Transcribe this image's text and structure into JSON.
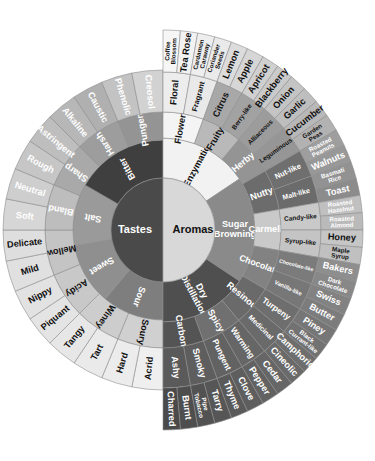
{
  "figure": {
    "center_left_label": "Tastes",
    "center_right_label": "Aromas"
  },
  "palette": {
    "center_dark": "#4a4a4a",
    "center_light": "#d8d8d8",
    "taste_ring1": "#8f8f8f",
    "taste_ring2": "#b8b8b8",
    "taste_ring3": "#e8e8e8",
    "aroma_ring1": "#6e6e6e",
    "aroma_ring2": "#8a8a8a",
    "aroma_ring3": "#bdbdbd",
    "aroma_ring4": "#9a9a9a",
    "stroke": "#8d8d8d",
    "bitter": "#3f3f3f",
    "dry_distillation": "#4f4f4f"
  },
  "chart_data": {
    "type": "pie",
    "legend": "none",
    "grid": false,
    "halves": [
      {
        "name": "Tastes",
        "side": "left",
        "start_angle": 90,
        "end_angle": 270,
        "ring1": [
          {
            "label": "Sour",
            "fill": "#7e7e7e",
            "text": "light",
            "span": 2
          },
          {
            "label": "Sweet",
            "fill": "#8f8f8f",
            "text": "light",
            "span": 2
          },
          {
            "label": "Salt",
            "fill": "#9a9a9a",
            "text": "light",
            "span": 2
          },
          {
            "label": "Bitter",
            "fill": "#3f3f3f",
            "text": "light",
            "span": 3
          }
        ],
        "ring2": [
          {
            "label": "Soury",
            "fill": "#d0d0d0",
            "text": "dark"
          },
          {
            "label": "Winey",
            "fill": "#cdcdcd",
            "text": "dark"
          },
          {
            "label": "Acidy",
            "fill": "#c8c8c8",
            "text": "dark"
          },
          {
            "label": "Mellow",
            "fill": "#c4c4c4",
            "text": "dark"
          },
          {
            "label": "Bland",
            "fill": "#bdbdbd",
            "text": "light"
          },
          {
            "label": "Sharp",
            "fill": "#a9a9a9",
            "text": "light"
          },
          {
            "label": "Harsh",
            "fill": "#9d9d9d",
            "text": "light"
          },
          {
            "label": "Pungent",
            "fill": "#949494",
            "text": "light"
          }
        ],
        "ring3": [
          {
            "label": "Acrid",
            "fill": "#efefef",
            "text": "dark"
          },
          {
            "label": "Hard",
            "fill": "#ececec",
            "text": "dark"
          },
          {
            "label": "Tart",
            "fill": "#eaeaea",
            "text": "dark"
          },
          {
            "label": "Tangy",
            "fill": "#e7e7e7",
            "text": "dark"
          },
          {
            "label": "Piquant",
            "fill": "#e4e4e4",
            "text": "dark"
          },
          {
            "label": "Nippy",
            "fill": "#e2e2e2",
            "text": "dark"
          },
          {
            "label": "Mild",
            "fill": "#e0e0e0",
            "text": "dark"
          },
          {
            "label": "Delicate",
            "fill": "#dedede",
            "text": "dark"
          },
          {
            "label": "Soft",
            "fill": "#d6d6d6",
            "text": "light"
          },
          {
            "label": "Neutral",
            "fill": "#cecece",
            "text": "light"
          },
          {
            "label": "Rough",
            "fill": "#c6c6c6",
            "text": "light"
          },
          {
            "label": "Astringent",
            "fill": "#bebebe",
            "text": "light"
          },
          {
            "label": "Alkaline",
            "fill": "#b7b7b7",
            "text": "light"
          },
          {
            "label": "Caustic",
            "fill": "#b0b0b0",
            "text": "light"
          },
          {
            "label": "Phenolic",
            "fill": "#c3c3c3",
            "text": "light"
          },
          {
            "label": "Creosol",
            "fill": "#d2d2d2",
            "text": "light"
          }
        ]
      },
      {
        "name": "Aromas",
        "side": "right",
        "start_angle": -90,
        "end_angle": 90,
        "ring1": [
          {
            "label": "Enzymatic",
            "fill": "#f2f2f2",
            "text": "dark",
            "span": 5
          },
          {
            "label": "Sugar Browning",
            "fill": "#8a8a8a",
            "text": "light",
            "span": 6
          },
          {
            "label": "Dry Distillation",
            "fill": "#4f4f4f",
            "text": "light",
            "span": 5
          }
        ],
        "ring2": [
          {
            "label": "Flowery",
            "fill": "#f4f4f4",
            "text": "dark",
            "span": 2
          },
          {
            "label": "Fruity",
            "fill": "#b9b9b9",
            "text": "dark",
            "span": 2
          },
          {
            "label": "Herby",
            "fill": "#949494",
            "text": "light",
            "span": 2
          },
          {
            "label": "Nutty",
            "fill": "#6c6c6c",
            "text": "light",
            "span": 2
          },
          {
            "label": "Carmelly",
            "fill": "#c9c9c9",
            "text": "light",
            "span": 2
          },
          {
            "label": "Chocolatey",
            "fill": "#828282",
            "text": "light",
            "span": 2
          },
          {
            "label": "Resinous",
            "fill": "#6a6a6a",
            "text": "light",
            "span": 2
          },
          {
            "label": "Spicy",
            "fill": "#707070",
            "text": "light",
            "span": 2
          },
          {
            "label": "Carbony",
            "fill": "#545454",
            "text": "light",
            "span": 2
          }
        ],
        "ring3": [
          {
            "label": "Floral",
            "fill": "#ededed",
            "text": "dark"
          },
          {
            "label": "Fragrant",
            "fill": "#e9e9e9",
            "text": "dark"
          },
          {
            "label": "Citrus",
            "fill": "#a8a8a8",
            "text": "dark"
          },
          {
            "label": "Berry-like",
            "fill": "#a2a2a2",
            "text": "dark"
          },
          {
            "label": "Alliaceous",
            "fill": "#9c9c9c",
            "text": "dark"
          },
          {
            "label": "Leguminous",
            "fill": "#969696",
            "text": "dark"
          },
          {
            "label": "Nut-like",
            "fill": "#6f6f6f",
            "text": "light"
          },
          {
            "label": "Malt-like",
            "fill": "#6b6b6b",
            "text": "light"
          },
          {
            "label": "Candy-like",
            "fill": "#c9c9c9",
            "text": "dark"
          },
          {
            "label": "Syrup-like",
            "fill": "#c4c4c4",
            "text": "dark"
          },
          {
            "label": "Chocolate-like",
            "fill": "#7b7b7b",
            "text": "light"
          },
          {
            "label": "Vanilla-like",
            "fill": "#777777",
            "text": "light"
          },
          {
            "label": "Turpeny",
            "fill": "#6e6e6e",
            "text": "light"
          },
          {
            "label": "Medicinal",
            "fill": "#6a6a6a",
            "text": "light"
          },
          {
            "label": "Warming",
            "fill": "#666666",
            "text": "light"
          },
          {
            "label": "Pungent",
            "fill": "#626262",
            "text": "light"
          },
          {
            "label": "Smoky",
            "fill": "#5e5e5e",
            "text": "light"
          },
          {
            "label": "Ashy",
            "fill": "#5a5a5a",
            "text": "light"
          }
        ],
        "ring4": [
          {
            "label": "Coffee Blossom",
            "fill": "#f6f6f6",
            "text": "dark"
          },
          {
            "label": "Tea Rose",
            "fill": "#f2f2f2",
            "text": "dark"
          },
          {
            "label": "Cardamon Caraway",
            "fill": "#eeeeee",
            "text": "dark"
          },
          {
            "label": "Coriander Seeds",
            "fill": "#eaeaea",
            "text": "dark"
          },
          {
            "label": "Lemon",
            "fill": "#dcdcdc",
            "text": "dark"
          },
          {
            "label": "Apple",
            "fill": "#d6d6d6",
            "text": "dark"
          },
          {
            "label": "Apricot",
            "fill": "#d0d0d0",
            "text": "dark"
          },
          {
            "label": "Blackberry",
            "fill": "#cacaca",
            "text": "dark"
          },
          {
            "label": "Onion",
            "fill": "#c4c4c4",
            "text": "dark"
          },
          {
            "label": "Garlic",
            "fill": "#bebebe",
            "text": "dark"
          },
          {
            "label": "Cucumber",
            "fill": "#b8b8b8",
            "text": "dark"
          },
          {
            "label": "Garden Peas",
            "fill": "#b2b2b2",
            "text": "dark"
          },
          {
            "label": "Roasted Peanuts",
            "fill": "#9e9e9e",
            "text": "light"
          },
          {
            "label": "Walnuts",
            "fill": "#989898",
            "text": "light"
          },
          {
            "label": "Basmati Rice",
            "fill": "#929292",
            "text": "light"
          },
          {
            "label": "Toast",
            "fill": "#8c8c8c",
            "text": "light"
          },
          {
            "label": "Roasted Hazelnut",
            "fill": "#c0c0c0",
            "text": "light"
          },
          {
            "label": "Roasted Almond",
            "fill": "#bababa",
            "text": "light"
          },
          {
            "label": "Honey",
            "fill": "#c6c6c6",
            "text": "dark"
          },
          {
            "label": "Maple Syrup",
            "fill": "#c0c0c0",
            "text": "dark"
          },
          {
            "label": "Bakers",
            "fill": "#8e8e8e",
            "text": "light"
          },
          {
            "label": "Dark Chocolate",
            "fill": "#888888",
            "text": "light"
          },
          {
            "label": "Swiss",
            "fill": "#828282",
            "text": "light"
          },
          {
            "label": "Butter",
            "fill": "#7c7c7c",
            "text": "light"
          },
          {
            "label": "Piney",
            "fill": "#767676",
            "text": "light"
          },
          {
            "label": "Black Currant-like",
            "fill": "#727272",
            "text": "light"
          },
          {
            "label": "Camphoric",
            "fill": "#6e6e6e",
            "text": "light"
          },
          {
            "label": "Cineolic",
            "fill": "#6a6a6a",
            "text": "light"
          },
          {
            "label": "Cedar",
            "fill": "#666666",
            "text": "light"
          },
          {
            "label": "Pepper",
            "fill": "#626262",
            "text": "light"
          },
          {
            "label": "Clove",
            "fill": "#5e5e5e",
            "text": "light"
          },
          {
            "label": "Thyme",
            "fill": "#5a5a5a",
            "text": "light"
          },
          {
            "label": "Tarry",
            "fill": "#565656",
            "text": "light"
          },
          {
            "label": "Pipe Tobacco",
            "fill": "#525252",
            "text": "light"
          },
          {
            "label": "Burnt",
            "fill": "#4e4e4e",
            "text": "light"
          },
          {
            "label": "Charred",
            "fill": "#4a4a4a",
            "text": "light"
          }
        ]
      }
    ]
  }
}
